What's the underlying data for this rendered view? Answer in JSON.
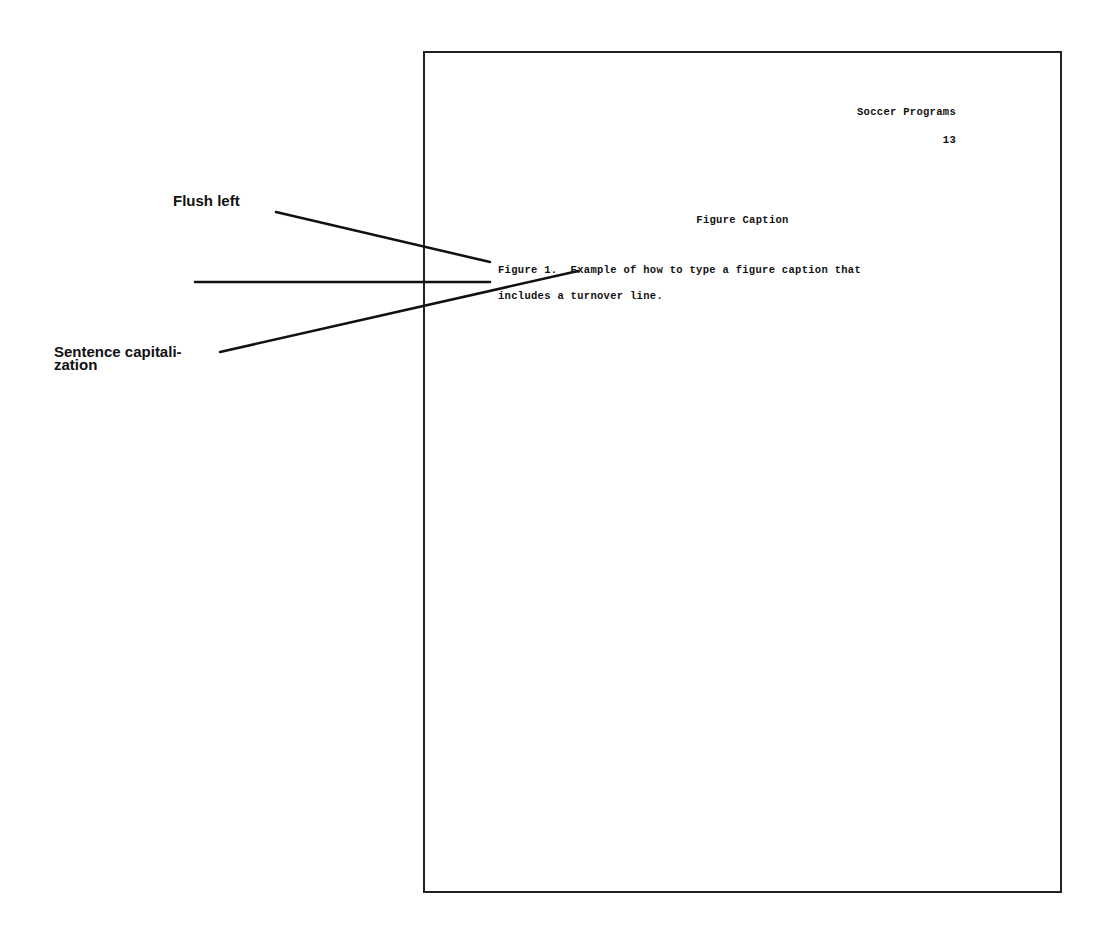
{
  "annotations": {
    "flush_left": "Flush left",
    "sentence_capitalization_line1": "Sentence capitali-",
    "sentence_capitalization_line2": "zation"
  },
  "page": {
    "running_head": "Soccer Programs",
    "page_number": "13",
    "heading": "Figure Caption",
    "caption_line_1": "Figure 1.  Example of how to type a figure caption that",
    "caption_line_2": "includes a turnover line."
  },
  "colors": {
    "ink": "#111111",
    "border": "#222222",
    "background": "#ffffff"
  }
}
